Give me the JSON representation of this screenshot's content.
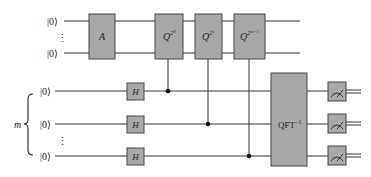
{
  "diagram": {
    "colors": {
      "gate_fill": "#a8a8a8",
      "gate_stroke": "#444444",
      "wire": "#333333",
      "background": "#ffffff"
    },
    "registers": {
      "target": {
        "qubits": [
          {
            "label": "|0⟩"
          },
          {
            "label": "|0⟩"
          }
        ],
        "ellipsis": "⋮"
      },
      "control": {
        "brace_label": "m",
        "qubits": [
          {
            "label": "|0⟩"
          },
          {
            "label": "|0⟩"
          },
          {
            "label": "|0⟩"
          }
        ],
        "ellipsis": "⋮"
      }
    },
    "gates": {
      "A": {
        "label": "A"
      },
      "Q0": {
        "base": "Q",
        "sup": "2",
        "supsup": "0"
      },
      "Q1": {
        "base": "Q",
        "sup": "2",
        "supsup": "1"
      },
      "Qm": {
        "base": "Q",
        "sup": "2",
        "supsup": "m−1"
      },
      "H": [
        {
          "label": "H"
        },
        {
          "label": "H"
        },
        {
          "label": "H"
        }
      ],
      "QFT": {
        "base": "QFT",
        "sup": "−1"
      },
      "measurements": [
        {
          "type": "meter"
        },
        {
          "type": "meter"
        },
        {
          "type": "meter"
        }
      ]
    }
  }
}
